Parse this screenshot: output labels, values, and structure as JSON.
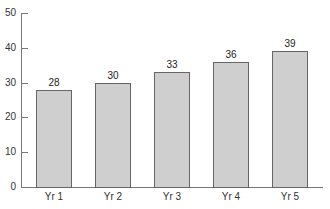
{
  "chart_data": {
    "type": "bar",
    "title": "",
    "xlabel": "",
    "ylabel": "",
    "categories": [
      "Yr 1",
      "Yr 2",
      "Yr 3",
      "Yr 4",
      "Yr 5"
    ],
    "values": [
      28,
      30,
      33,
      36,
      39
    ],
    "ylim": [
      0,
      50
    ],
    "yticks": [
      0,
      10,
      20,
      30,
      40,
      50
    ],
    "data_labels": true,
    "grid": false,
    "legend": null,
    "bar_color": "#cfcfcf",
    "bar_edge_color": "#666666"
  },
  "axis": {
    "y_tick_labels": [
      "0",
      "10",
      "20",
      "30",
      "40",
      "50"
    ]
  },
  "bars": [
    {
      "label": "Yr 1",
      "value": "28"
    },
    {
      "label": "Yr 2",
      "value": "30"
    },
    {
      "label": "Yr 3",
      "value": "33"
    },
    {
      "label": "Yr 4",
      "value": "36"
    },
    {
      "label": "Yr 5",
      "value": "39"
    }
  ]
}
